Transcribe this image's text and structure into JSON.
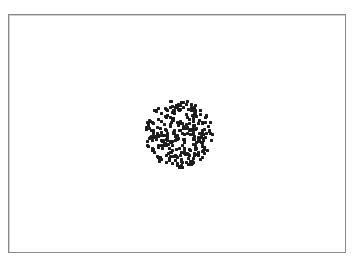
{
  "canvas": {
    "width": 359,
    "height": 261,
    "background": "#ffffff",
    "frame": {
      "left": 8,
      "top": 14,
      "width": 336,
      "height": 237,
      "border_color": "#8a8a8a"
    }
  },
  "dot_cluster": {
    "shape": "disc",
    "center_x": 179,
    "center_y": 134,
    "radius": 34,
    "dot_count": 300,
    "dot_size": 3,
    "dot_color": "#1c1c1c",
    "seed": 7
  }
}
